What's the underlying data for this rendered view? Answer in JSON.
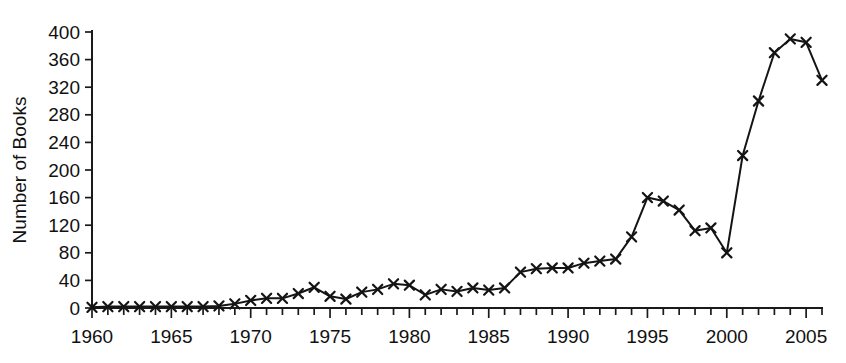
{
  "chart_data": {
    "type": "line",
    "title": "",
    "subtitle": "",
    "xlabel": "",
    "ylabel": "Number of Books",
    "xlim": [
      1960,
      2006
    ],
    "ylim": [
      0,
      400
    ],
    "grid": false,
    "legend": null,
    "marker": "x",
    "line_color": "#141414",
    "y_ticks": [
      0,
      40,
      80,
      120,
      160,
      200,
      240,
      280,
      320,
      360,
      400
    ],
    "y_tick_labels": [
      "0",
      "40",
      "80",
      "120",
      "160",
      "200",
      "240",
      "280",
      "320",
      "360",
      "400"
    ],
    "x_ticks": [
      1960,
      1961,
      1962,
      1963,
      1964,
      1965,
      1966,
      1967,
      1968,
      1969,
      1970,
      1971,
      1972,
      1973,
      1974,
      1975,
      1976,
      1977,
      1978,
      1979,
      1980,
      1981,
      1982,
      1983,
      1984,
      1985,
      1986,
      1987,
      1988,
      1989,
      1990,
      1991,
      1992,
      1993,
      1994,
      1995,
      1996,
      1997,
      1998,
      1999,
      2000,
      2001,
      2002,
      2003,
      2004,
      2005,
      2006
    ],
    "x_tick_labels": [
      "1960",
      "1965",
      "1970",
      "1975",
      "1980",
      "1985",
      "1990",
      "1995",
      "2000",
      "2005"
    ],
    "x_labeled_ticks": [
      1960,
      1965,
      1970,
      1975,
      1980,
      1985,
      1990,
      1995,
      2000,
      2005
    ],
    "x": [
      1960,
      1961,
      1962,
      1963,
      1964,
      1965,
      1966,
      1967,
      1968,
      1969,
      1970,
      1971,
      1972,
      1973,
      1974,
      1975,
      1976,
      1977,
      1978,
      1979,
      1980,
      1981,
      1982,
      1983,
      1984,
      1985,
      1986,
      1987,
      1988,
      1989,
      1990,
      1991,
      1992,
      1993,
      1994,
      1995,
      1996,
      1997,
      1998,
      1999,
      2000,
      2001,
      2002,
      2003,
      2004,
      2005,
      2006
    ],
    "values": [
      1,
      2,
      2,
      2,
      2,
      2,
      2,
      2,
      3,
      6,
      11,
      14,
      14,
      21,
      30,
      17,
      13,
      23,
      27,
      35,
      33,
      19,
      27,
      24,
      29,
      26,
      29,
      52,
      57,
      58,
      58,
      65,
      68,
      71,
      103,
      160,
      155,
      142,
      112,
      116,
      80,
      221,
      300,
      370,
      390,
      385,
      330
    ]
  }
}
